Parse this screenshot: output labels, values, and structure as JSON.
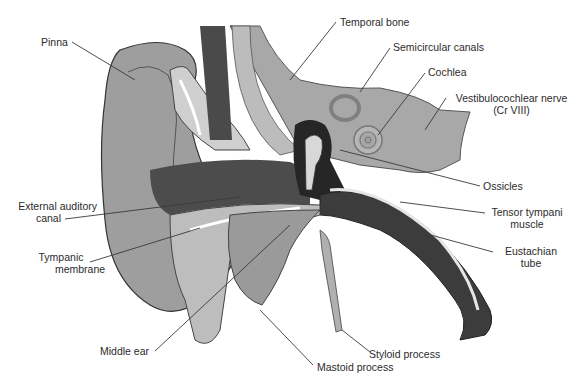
{
  "diagram": {
    "colors": {
      "background": "#ffffff",
      "tissue_light": "#b8b8b8",
      "tissue_mid": "#8e8e8e",
      "tissue_dark": "#3a3a3a",
      "canal_dark": "#4a4a4a",
      "bone_light": "#c8c8c8",
      "leader_line": "#3a3a3a",
      "label_text": "#2b2b2b"
    },
    "labels": {
      "pinna": "Pinna",
      "temporal_bone": "Temporal bone",
      "semicircular_canals": "Semicircular canals",
      "cochlea": "Cochlea",
      "vestibulocochlear_nerve_line1": "Vestibulocochlear nerve",
      "vestibulocochlear_nerve_line2": "(Cr VIII)",
      "external_auditory_canal_line1": "External auditory",
      "external_auditory_canal_line2": "canal",
      "ossicles": "Ossicles",
      "tensor_tympani_line1": "Tensor tympani",
      "tensor_tympani_line2": "muscle",
      "tympanic_membrane_line1": "Tympanic",
      "tympanic_membrane_line2": "membrane",
      "eustachian_tube_line1": "Eustachian",
      "eustachian_tube_line2": "tube",
      "middle_ear": "Middle ear",
      "styloid_process": "Styloid process",
      "mastoid_process": "Mastoid process"
    }
  }
}
